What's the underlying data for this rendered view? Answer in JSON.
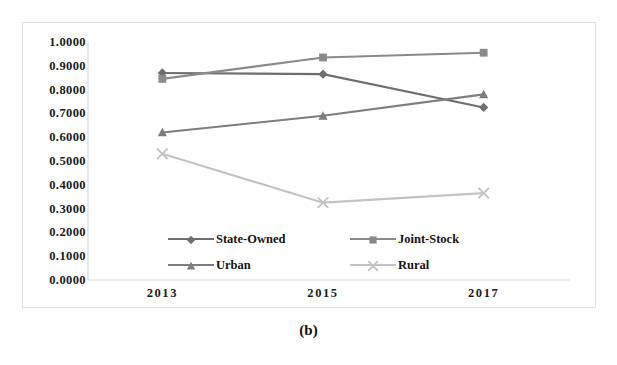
{
  "caption": "(b)",
  "chart_data": {
    "type": "line",
    "title": "",
    "xlabel": "",
    "ylabel": "",
    "categories": [
      "2013",
      "2015",
      "2017"
    ],
    "x": [
      2013,
      2015,
      2017
    ],
    "ylim": [
      0.0,
      1.0
    ],
    "grid": false,
    "legend_position": "inside-bottom",
    "ytick_labels": [
      "1.0000",
      "0.9000",
      "0.8000",
      "0.7000",
      "0.6000",
      "0.5000",
      "0.4000",
      "0.3000",
      "0.2000",
      "0.1000",
      "0.0000"
    ],
    "ytick_values": [
      1.0,
      0.9,
      0.8,
      0.7,
      0.6,
      0.5,
      0.4,
      0.3,
      0.2,
      0.1,
      0.0
    ],
    "series": [
      {
        "name": "State-Owned",
        "marker": "diamond",
        "color": "#6e6e6e",
        "values": [
          0.87,
          0.865,
          0.725
        ]
      },
      {
        "name": "Joint-Stock",
        "marker": "square",
        "color": "#8a8a8a",
        "values": [
          0.845,
          0.935,
          0.955
        ]
      },
      {
        "name": "Urban",
        "marker": "triangle",
        "color": "#7d7d7d",
        "values": [
          0.62,
          0.69,
          0.78
        ]
      },
      {
        "name": "Rural",
        "marker": "cross",
        "color": "#c3c3c3",
        "values": [
          0.53,
          0.325,
          0.365
        ]
      }
    ]
  },
  "legend": {
    "items": [
      {
        "label": "State-Owned"
      },
      {
        "label": "Joint-Stock"
      },
      {
        "label": "Urban"
      },
      {
        "label": "Rural"
      }
    ]
  },
  "axis": {
    "axis_line_color": "#d9d9d9",
    "tick_text_color": "#1a1a1a"
  }
}
